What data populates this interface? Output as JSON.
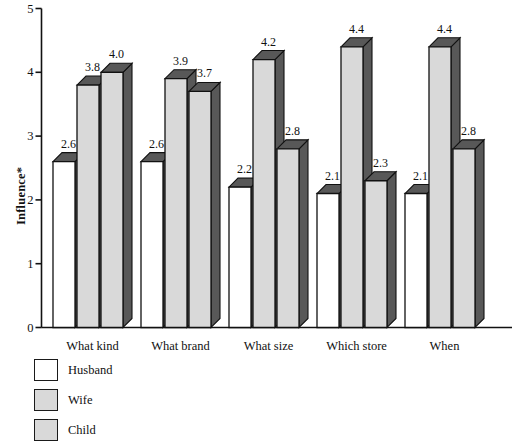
{
  "chart_data": {
    "type": "bar",
    "title": "",
    "subtitle": "",
    "xlabel": "",
    "ylabel": "Influence*",
    "categories": [
      "What kind",
      "What brand",
      "What size",
      "Which store",
      "When"
    ],
    "series": [
      {
        "name": "Husband",
        "values": [
          2.6,
          2.6,
          2.2,
          2.1,
          2.1
        ],
        "color": "#ffffff"
      },
      {
        "name": "Wife",
        "values": [
          3.8,
          3.9,
          4.2,
          4.4,
          4.4
        ],
        "color": "#d9d9d9"
      },
      {
        "name": "Child",
        "values": [
          4.0,
          3.7,
          2.8,
          2.3,
          2.8
        ],
        "color": "#d9d9d9"
      }
    ],
    "data_labels": [
      [
        "2.6",
        "3.8",
        "4.0"
      ],
      [
        "2.6",
        "3.9",
        "3.7"
      ],
      [
        "2.2",
        "4.2",
        "2.8"
      ],
      [
        "2.1",
        "4.4",
        "2.3"
      ],
      [
        "2.1",
        "4.4",
        "2.8"
      ]
    ],
    "ylim": [
      0,
      5
    ],
    "yticks": [
      "0",
      "1",
      "2",
      "3",
      "4",
      "5"
    ],
    "grid": false,
    "legend_position": "below-left",
    "style": {
      "bar_face": "#d9d9d9",
      "bar_face_husband": "#ffffff",
      "bar_shade": "#585858",
      "bar_outline": "#111111",
      "axis_color": "#111111"
    }
  },
  "legend": {
    "items": [
      {
        "label": "Husband",
        "swatch": "#ffffff"
      },
      {
        "label": "Wife",
        "swatch": "#d9d9d9"
      },
      {
        "label": "Child",
        "swatch": "#d9d9d9"
      }
    ]
  }
}
